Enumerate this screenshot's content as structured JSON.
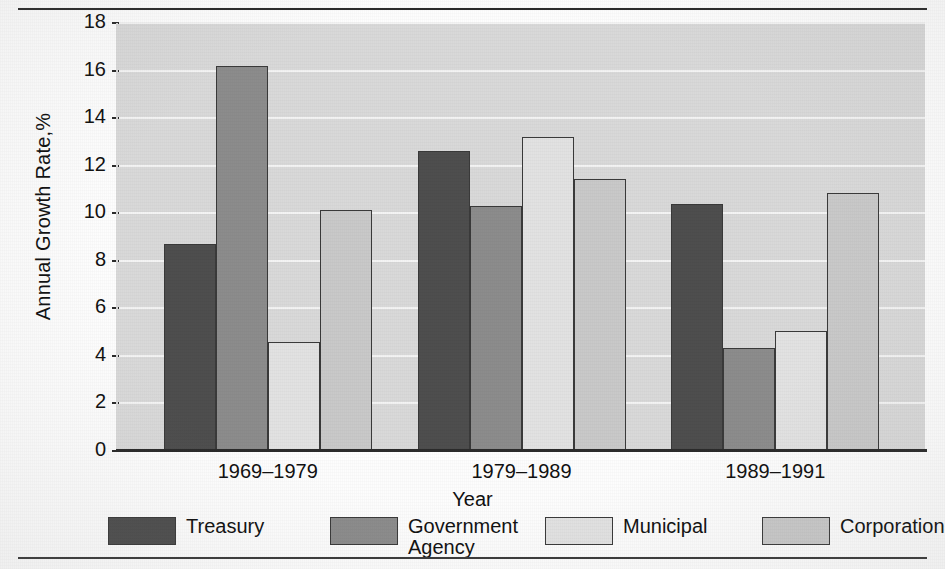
{
  "chart_data": {
    "type": "bar",
    "title": "",
    "subtitle": "",
    "xlabel": "Year",
    "ylabel": "Annual Growth Rate,%",
    "categories": [
      "1969–1979",
      "1979–1989",
      "1989–1991"
    ],
    "series": [
      {
        "name": "Treasury",
        "color": "#4e4e4e",
        "values": [
          8.7,
          12.6,
          10.4
        ]
      },
      {
        "name": "Government\nAgency",
        "color": "#8c8c8c",
        "values": [
          16.2,
          10.3,
          4.35
        ]
      },
      {
        "name": "Municipal",
        "color": "#e2e2e2",
        "values": [
          4.6,
          13.2,
          5.05
        ]
      },
      {
        "name": "Corporation",
        "color": "#c9c9c9",
        "values": [
          10.15,
          11.45,
          10.85
        ]
      }
    ],
    "ylim": [
      0,
      18
    ],
    "yticks": [
      0,
      2,
      4,
      6,
      8,
      10,
      12,
      14,
      16,
      18
    ],
    "ytick_labels": [
      "0",
      "2",
      "4",
      "6",
      "8",
      "10",
      "12",
      "14",
      "16",
      "18"
    ],
    "grid": "horizontal",
    "legend_position": "bottom",
    "legend_entries": [
      "Treasury",
      "Government\nAgency",
      "Municipal",
      "Corporation"
    ],
    "plot_background": "#d9d9d9",
    "gridline_color": "#f4f4f4",
    "axis_color": "#2b2b2b"
  }
}
